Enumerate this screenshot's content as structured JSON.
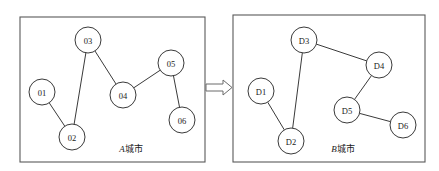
{
  "figure": {
    "background_color": "#ffffff",
    "stroke_color": "#3a3a3a",
    "panel_border_color": "#5a5a5a"
  },
  "panels": [
    {
      "id": "panel-a",
      "caption_prefix": "A",
      "caption_suffix": "城市",
      "caption_full": "A城市",
      "rect": {
        "x": 20,
        "y": 17,
        "width": 185,
        "height": 145
      },
      "caption_pos": {
        "x": 131,
        "y": 149
      },
      "nodes": [
        {
          "id": "n01",
          "label": "01",
          "x": 42,
          "y": 92,
          "r": 13
        },
        {
          "id": "n02",
          "label": "02",
          "x": 72,
          "y": 137,
          "r": 13
        },
        {
          "id": "n03",
          "label": "03",
          "x": 88,
          "y": 40,
          "r": 13
        },
        {
          "id": "n04",
          "label": "04",
          "x": 123,
          "y": 95,
          "r": 13
        },
        {
          "id": "n05",
          "label": "05",
          "x": 171,
          "y": 63,
          "r": 13
        },
        {
          "id": "n06",
          "label": "06",
          "x": 182,
          "y": 120,
          "r": 13
        }
      ],
      "edges": [
        {
          "from": "n01",
          "to": "n02"
        },
        {
          "from": "n02",
          "to": "n03"
        },
        {
          "from": "n03",
          "to": "n04"
        },
        {
          "from": "n04",
          "to": "n05"
        },
        {
          "from": "n05",
          "to": "n06"
        }
      ]
    },
    {
      "id": "panel-b",
      "caption_prefix": "B",
      "caption_suffix": "城市",
      "caption_full": "B城市",
      "rect": {
        "x": 233,
        "y": 15,
        "width": 192,
        "height": 147
      },
      "caption_pos": {
        "x": 343,
        "y": 149
      },
      "nodes": [
        {
          "id": "d1",
          "label": "D1",
          "x": 261,
          "y": 91,
          "r": 13
        },
        {
          "id": "d2",
          "label": "D2",
          "x": 291,
          "y": 141,
          "r": 13
        },
        {
          "id": "d3",
          "label": "D3",
          "x": 304,
          "y": 40,
          "r": 13
        },
        {
          "id": "d4",
          "label": "D4",
          "x": 379,
          "y": 65,
          "r": 13
        },
        {
          "id": "d5",
          "label": "D5",
          "x": 347,
          "y": 110,
          "r": 13
        },
        {
          "id": "d6",
          "label": "D6",
          "x": 403,
          "y": 125,
          "r": 13
        }
      ],
      "edges": [
        {
          "from": "d1",
          "to": "d2"
        },
        {
          "from": "d2",
          "to": "d3"
        },
        {
          "from": "d3",
          "to": "d4"
        },
        {
          "from": "d4",
          "to": "d5"
        },
        {
          "from": "d5",
          "to": "d6"
        }
      ]
    }
  ],
  "arrow": {
    "name": "transform-arrow",
    "direction": "right",
    "x": 206,
    "y": 84,
    "length": 26,
    "shaft_height": 7,
    "head_height": 15,
    "head_length": 9
  }
}
